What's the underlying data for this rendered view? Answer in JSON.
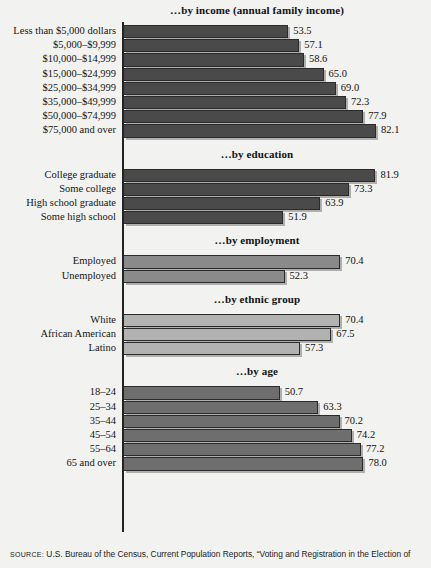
{
  "figure": {
    "background": "#f2f2f0",
    "axis_color": "#232323"
  },
  "source": {
    "kicker": "SOURCE:",
    "text": " U.S. Bureau of the Census, Current Population Reports, “Voting and Registration in the Election of"
  },
  "chart_data": {
    "type": "bar",
    "orientation": "horizontal",
    "title": "",
    "xlabel": "",
    "ylabel": "",
    "xlim": [
      0,
      100
    ],
    "grid": false,
    "legend": "none",
    "value_format": "one decimal (percent)",
    "sections": [
      {
        "id": "income",
        "title": "…by income (annual family income)",
        "bar_color": "#4a4a4a",
        "categories": [
          "Less than $5,000 dollars",
          "$5,000–$9,999",
          "$10,000–$14,999",
          "$15,000–$24,999",
          "$25,000–$34,999",
          "$35,000–$49,999",
          "$50,000–$74,999",
          "$75,000 and over"
        ],
        "values": [
          53.5,
          57.1,
          58.6,
          65.0,
          69.0,
          72.3,
          77.9,
          82.1
        ]
      },
      {
        "id": "education",
        "title": "…by education",
        "bar_color": "#4a4a4a",
        "categories": [
          "College graduate",
          "Some college",
          "High school graduate",
          "Some high school"
        ],
        "values": [
          81.9,
          73.3,
          63.9,
          51.9
        ]
      },
      {
        "id": "employment",
        "title": "…by employment",
        "bar_color": "#8a8a8a",
        "categories": [
          "Employed",
          "Unemployed"
        ],
        "values": [
          70.4,
          52.3
        ]
      },
      {
        "id": "ethnic-group",
        "title": "…by ethnic group",
        "bar_color": "#b2b2b2",
        "categories": [
          "White",
          "African American",
          "Latino"
        ],
        "values": [
          70.4,
          67.5,
          57.3
        ]
      },
      {
        "id": "age",
        "title": "…by age",
        "bar_color": "#6e6e6e",
        "categories": [
          "18–24",
          "25–34",
          "35–44",
          "45–54",
          "55–64",
          "65 and over"
        ],
        "values": [
          50.7,
          63.3,
          70.2,
          74.2,
          77.2,
          78.0
        ]
      }
    ]
  }
}
